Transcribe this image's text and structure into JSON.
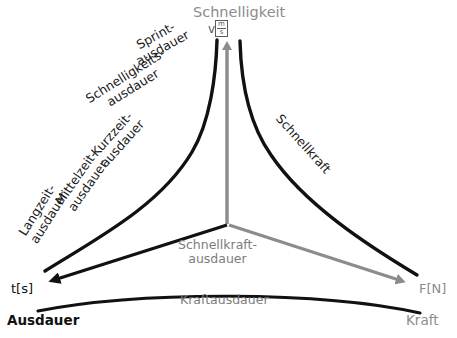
{
  "diagram": {
    "type": "triangle-continuum-diagram",
    "axes": {
      "top": {
        "name": "Schnelligkeit",
        "unit": "v",
        "unit_numerator": "m",
        "unit_denominator": "s",
        "color": "#8c8c8c",
        "arrow_direction": "up"
      },
      "left": {
        "name": "Ausdauer",
        "unit": "t[s]",
        "color": "#111111",
        "arrow_direction": "down-left"
      },
      "right": {
        "name": "Kraft",
        "unit": "F[N]",
        "color": "#8c8c8c",
        "arrow_direction": "down-right"
      }
    },
    "curve_labels": [
      {
        "id": "sprintausdauer",
        "line1": "Sprint-",
        "line2": "ausdauer",
        "color": "#1a1a1a"
      },
      {
        "id": "schnelligkeitsausdauer",
        "line1": "Schnelligkeits-",
        "line2": "ausdauer",
        "color": "#1a1a1a"
      },
      {
        "id": "kurzzeitausdauer",
        "line1": "Kurzzeit-",
        "line2": "ausdauer",
        "color": "#1a1a1a"
      },
      {
        "id": "mittelzeitausdauer",
        "line1": "Mittelzeit-",
        "line2": "ausdauer",
        "color": "#1a1a1a"
      },
      {
        "id": "langzeitausdauer",
        "line1": "Langzeit-",
        "line2": "ausdauer",
        "color": "#1a1a1a"
      },
      {
        "id": "schnellkraft",
        "line1": "Schnellkraft",
        "line2": "",
        "color": "#1a1a1a"
      },
      {
        "id": "schnellkraftausdauer",
        "line1": "Schnellkraft-",
        "line2": "ausdauer",
        "color": "#7d7d7d"
      },
      {
        "id": "kraftausdauer",
        "line1": "Kraftausdauer",
        "line2": "",
        "color": "#7d7d7d"
      }
    ],
    "colors": {
      "black": "#111111",
      "gray": "#8c8c8c",
      "label_gray": "#7d7d7d",
      "background": "#ffffff"
    }
  }
}
